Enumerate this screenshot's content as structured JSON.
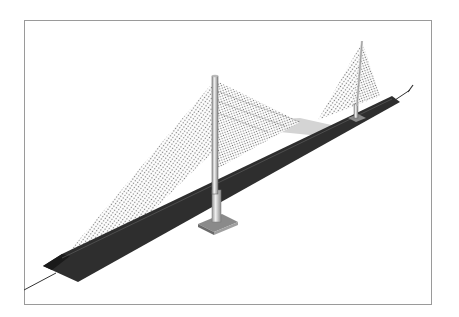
{
  "figure": {
    "caption": "",
    "colors": {
      "background": "#ffffff",
      "frame": "#9a9a9a",
      "deck": "#2e2e2e",
      "deck_edge": "#1a1a1a",
      "cables": "#555555",
      "tower": "#dcdcdc",
      "tower_edge": "#6a6a6a",
      "footing": "#8a8a8a",
      "shadow": "#cfcfcf"
    },
    "towers": [
      {
        "name": "main-tower",
        "top": [
          215,
          76
        ],
        "base": [
          215,
          218
        ]
      },
      {
        "name": "rear-tower",
        "top": [
          362,
          42
        ],
        "base": [
          357,
          117
        ]
      }
    ]
  }
}
